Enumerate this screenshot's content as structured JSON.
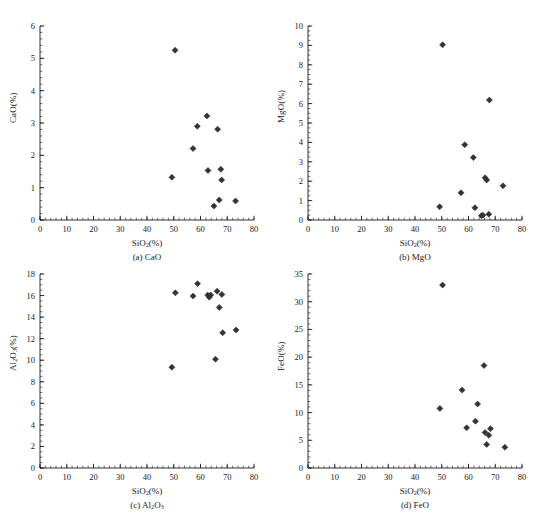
{
  "figure": {
    "top_caption": "",
    "marker_color": "#333333",
    "axis_color": "#1a1a1a",
    "background": "#ffffff"
  },
  "chart_data": [
    {
      "type": "scatter",
      "id": "a",
      "title": "(a) CaO",
      "xlabel": "SiO2(%)",
      "ylabel": "CaO(%)",
      "xlim": [
        0,
        80
      ],
      "ylim": [
        0,
        6
      ],
      "xticks": [
        0,
        10,
        20,
        30,
        40,
        50,
        60,
        70,
        80
      ],
      "yticks": [
        0,
        1,
        2,
        3,
        4,
        5,
        6
      ],
      "x_minor_step": 2,
      "y_minor_step": 0.2,
      "grid": false,
      "legend": "none",
      "points": [
        {
          "x": 49.3,
          "y": 1.32
        },
        {
          "x": 50.5,
          "y": 5.25
        },
        {
          "x": 57.2,
          "y": 2.21
        },
        {
          "x": 58.8,
          "y": 2.9
        },
        {
          "x": 62.4,
          "y": 3.22
        },
        {
          "x": 62.8,
          "y": 1.53
        },
        {
          "x": 65.0,
          "y": 0.43
        },
        {
          "x": 66.4,
          "y": 2.81
        },
        {
          "x": 67.0,
          "y": 0.62
        },
        {
          "x": 67.6,
          "y": 1.57
        },
        {
          "x": 67.9,
          "y": 1.24
        },
        {
          "x": 73.1,
          "y": 0.59
        }
      ]
    },
    {
      "type": "scatter",
      "id": "b",
      "title": "(b) MgO",
      "xlabel": "SiO2(%)",
      "ylabel": "MgO(%)",
      "xlim": [
        0,
        80
      ],
      "ylim": [
        0,
        10
      ],
      "xticks": [
        0,
        10,
        20,
        30,
        40,
        50,
        60,
        70,
        80
      ],
      "yticks": [
        0,
        1,
        2,
        3,
        4,
        5,
        6,
        7,
        8,
        9,
        10
      ],
      "x_minor_step": 2,
      "y_minor_step": 0.25,
      "grid": false,
      "legend": "none",
      "points": [
        {
          "x": 49.2,
          "y": 0.68
        },
        {
          "x": 50.3,
          "y": 9.03
        },
        {
          "x": 57.2,
          "y": 1.4
        },
        {
          "x": 58.6,
          "y": 3.88
        },
        {
          "x": 61.8,
          "y": 3.22
        },
        {
          "x": 62.4,
          "y": 0.63
        },
        {
          "x": 64.8,
          "y": 0.22
        },
        {
          "x": 65.4,
          "y": 0.25
        },
        {
          "x": 66.2,
          "y": 2.18
        },
        {
          "x": 66.8,
          "y": 2.06
        },
        {
          "x": 67.6,
          "y": 0.3
        },
        {
          "x": 67.8,
          "y": 6.18
        },
        {
          "x": 72.9,
          "y": 1.76
        }
      ]
    },
    {
      "type": "scatter",
      "id": "c",
      "title": "(c) Al2O3",
      "xlabel": "SiO2(%)",
      "ylabel": "Al2O3(%)",
      "xlim": [
        0,
        80
      ],
      "ylim": [
        0,
        18
      ],
      "xticks": [
        0,
        10,
        20,
        30,
        40,
        50,
        60,
        70,
        80
      ],
      "yticks": [
        0,
        2,
        4,
        6,
        8,
        10,
        12,
        14,
        16,
        18
      ],
      "x_minor_step": 2,
      "y_minor_step": 0.5,
      "grid": false,
      "legend": "none",
      "points": [
        {
          "x": 49.3,
          "y": 9.35
        },
        {
          "x": 50.6,
          "y": 16.25
        },
        {
          "x": 57.2,
          "y": 15.95
        },
        {
          "x": 58.9,
          "y": 17.1
        },
        {
          "x": 62.7,
          "y": 16.05
        },
        {
          "x": 63.3,
          "y": 15.85
        },
        {
          "x": 63.8,
          "y": 16.05
        },
        {
          "x": 65.6,
          "y": 10.1
        },
        {
          "x": 66.2,
          "y": 16.4
        },
        {
          "x": 67.0,
          "y": 14.9
        },
        {
          "x": 68.0,
          "y": 16.1
        },
        {
          "x": 68.3,
          "y": 12.55
        },
        {
          "x": 73.3,
          "y": 12.8
        }
      ]
    },
    {
      "type": "scatter",
      "id": "d",
      "title": "(d) FeO",
      "xlabel": "SiO2(%)",
      "ylabel": "FeO(%)",
      "xlim": [
        0,
        80
      ],
      "ylim": [
        0,
        35
      ],
      "xticks": [
        0,
        10,
        20,
        30,
        40,
        50,
        60,
        70,
        80
      ],
      "yticks": [
        0,
        5,
        10,
        15,
        20,
        25,
        30,
        35
      ],
      "x_minor_step": 2,
      "y_minor_step": 1,
      "grid": false,
      "legend": "none",
      "points": [
        {
          "x": 49.3,
          "y": 10.75
        },
        {
          "x": 50.3,
          "y": 33.0
        },
        {
          "x": 57.6,
          "y": 14.05
        },
        {
          "x": 59.3,
          "y": 7.25
        },
        {
          "x": 62.6,
          "y": 8.45
        },
        {
          "x": 63.4,
          "y": 11.55
        },
        {
          "x": 65.8,
          "y": 18.5
        },
        {
          "x": 66.2,
          "y": 6.4
        },
        {
          "x": 66.8,
          "y": 4.25
        },
        {
          "x": 67.6,
          "y": 5.9
        },
        {
          "x": 68.2,
          "y": 7.1
        },
        {
          "x": 73.6,
          "y": 3.75
        }
      ]
    }
  ]
}
